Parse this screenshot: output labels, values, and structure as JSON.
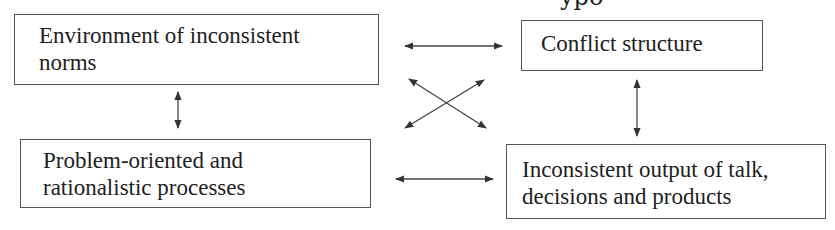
{
  "diagram": {
    "clipped_top_text": "ypo",
    "nodes": [
      {
        "id": "env",
        "label": "Environment of inconsistent\nnorms"
      },
      {
        "id": "conf",
        "label": "Conflict structure"
      },
      {
        "id": "prob",
        "label": "Problem-oriented and\nrationalistic processes"
      },
      {
        "id": "out",
        "label": "Inconsistent output of talk,\ndecisions and products"
      }
    ],
    "edges": [
      {
        "from": "env",
        "to": "conf",
        "type": "bidirectional"
      },
      {
        "from": "env",
        "to": "prob",
        "type": "bidirectional"
      },
      {
        "from": "conf",
        "to": "out",
        "type": "bidirectional"
      },
      {
        "from": "prob",
        "to": "out",
        "type": "bidirectional"
      },
      {
        "from": "env",
        "to": "out",
        "type": "bidirectional"
      },
      {
        "from": "prob",
        "to": "conf",
        "type": "bidirectional"
      }
    ],
    "colors": {
      "line": "#333333",
      "border": "#555555",
      "text": "#1e1e1e",
      "background": "#ffffff"
    }
  }
}
